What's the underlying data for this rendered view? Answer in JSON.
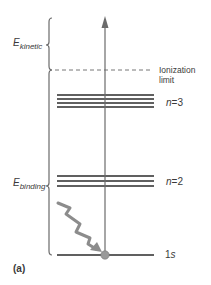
{
  "diagram": {
    "panel_label": "(a)",
    "labels": {
      "e_kinetic": {
        "symbol": "E",
        "subscript": "kinetic"
      },
      "e_binding": {
        "symbol": "E",
        "subscript": "binding"
      },
      "ionization_limit_line1": "Ionization",
      "ionization_limit_line2": "limit",
      "n3": {
        "var": "n",
        "eq": "=3"
      },
      "n2": {
        "var": "n",
        "eq": "=2"
      },
      "ground": {
        "num": "1",
        "letter": "s"
      }
    },
    "levels": [
      {
        "name": "ionization-limit",
        "style": "dashed"
      },
      {
        "name": "n=3",
        "lines": 4
      },
      {
        "name": "n=2",
        "lines": 3
      },
      {
        "name": "1s",
        "lines": 1
      }
    ],
    "colors": {
      "level_line": "#2b2b2b",
      "axis": "#6b6b6b",
      "photon": "#8c8c8c",
      "electron": "#9a9a9a",
      "dashed": "#777777"
    }
  }
}
